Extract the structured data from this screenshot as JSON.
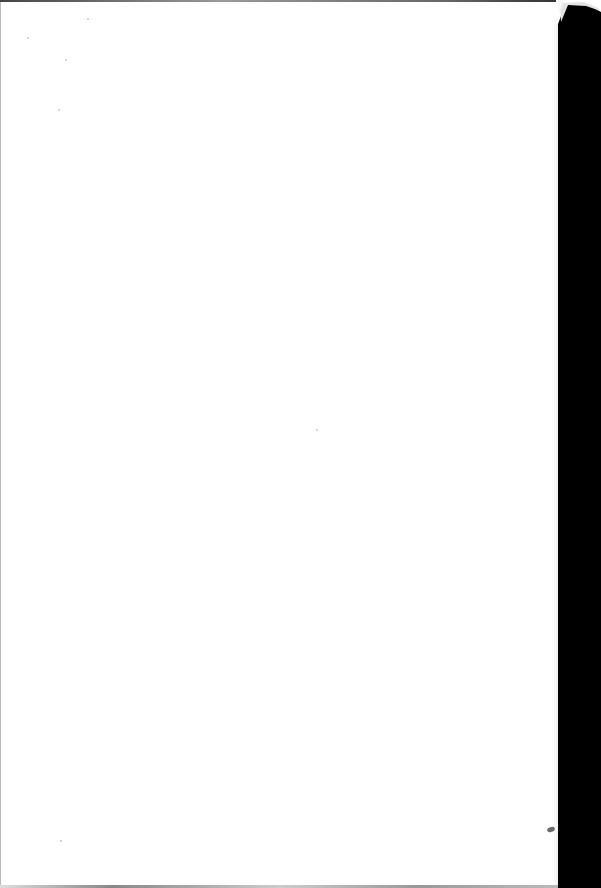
{
  "document": {
    "type": "scanned-page",
    "content": "blank",
    "page_color": "#ffffff",
    "background_color": "#000000"
  }
}
